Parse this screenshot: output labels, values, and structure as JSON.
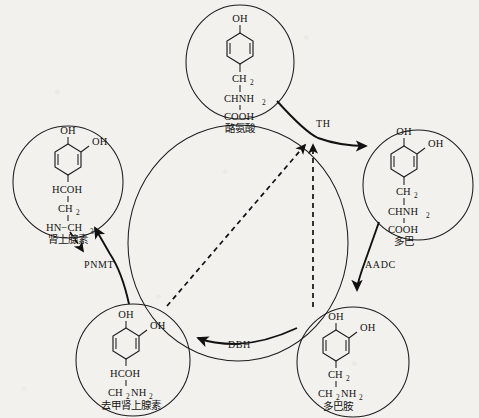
{
  "figure": {
    "background_color": "#f2f1ee",
    "line_color": "#1d1d1d"
  },
  "molecules": [
    {
      "id": "tyrosine",
      "position": "top",
      "name_cn": "酪氨酸",
      "hydroxyls": [
        "OH"
      ],
      "chain": [
        "CH",
        "2",
        "CHNH",
        "2",
        "COOH"
      ],
      "lines": {
        "l1": "CH",
        "l1sub": "2",
        "l2": "CHNH",
        "l2sub": "2",
        "l3": "COOH"
      },
      "ring_oh_top": "OH"
    },
    {
      "id": "dopa",
      "position": "right",
      "name_cn": "多巴",
      "ring_oh_top": "OH",
      "ring_oh_side": "OH",
      "lines": {
        "l1": "CH",
        "l1sub": "2",
        "l2": "CHNH",
        "l2sub": "2",
        "l3": "COOH"
      }
    },
    {
      "id": "dopamine",
      "position": "bottom-right",
      "name_cn": "多巴胺",
      "ring_oh_top": "OH",
      "ring_oh_side": "OH",
      "lines": {
        "l1": "CH",
        "l1sub": "2",
        "l2": "CH",
        "l2sub": "2",
        "l2b": "NH",
        "l2bsub": "2"
      }
    },
    {
      "id": "norepinephrine",
      "position": "bottom-left",
      "name_cn": "去甲肾上腺素",
      "ring_oh_top": "OH",
      "ring_oh_side": "OH",
      "lines": {
        "l1": "HCOH",
        "l2": "CH",
        "l2sub": "2",
        "l2b": "NH",
        "l2bsub": "2"
      }
    },
    {
      "id": "epinephrine",
      "position": "left",
      "name_cn": "肾上腺素",
      "ring_oh_top": "OH",
      "ring_oh_side": "OH",
      "lines": {
        "l1": "HCOH",
        "l2": "CH",
        "l2sub": "2",
        "l3": "HN−CH",
        "l3sub": "3"
      }
    }
  ],
  "enzymes": [
    {
      "id": "TH",
      "label": "TH",
      "step": "tyrosine → dopa"
    },
    {
      "id": "AADC",
      "label": "AADC",
      "step": "dopa → dopamine"
    },
    {
      "id": "DBH",
      "label": "DBH",
      "step": "dopamine → norepinephrine"
    },
    {
      "id": "PNMT",
      "label": "PNMT",
      "step": "norepinephrine → epinephrine"
    }
  ],
  "feedback": [
    {
      "from": "dopamine",
      "to": "TH",
      "style": "dashed"
    },
    {
      "from": "norepinephrine",
      "to": "TH",
      "style": "dashed"
    }
  ]
}
